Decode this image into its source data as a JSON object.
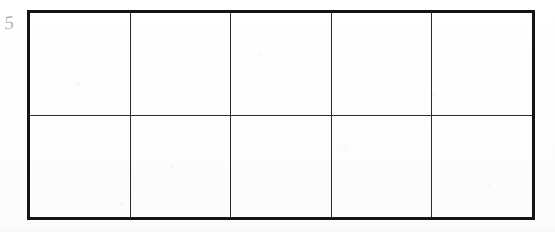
{
  "document": {
    "type": "scanned-worksheet",
    "title": "Empty grid table",
    "background_color": "#fefefe",
    "ink_color": "#141414"
  },
  "margin_annotation": {
    "name": "handwritten-mark",
    "text": "5"
  },
  "grid": {
    "rows": 2,
    "columns": 5,
    "outer_border_color": "#141414",
    "inner_line_color": "#2b2b2b",
    "cells": [
      [
        "",
        "",
        "",
        "",
        ""
      ],
      [
        "",
        "",
        "",
        "",
        ""
      ]
    ]
  }
}
